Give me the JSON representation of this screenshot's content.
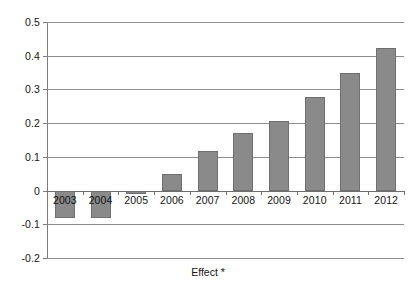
{
  "chart_data": {
    "type": "bar",
    "title": "",
    "subtitle": "",
    "xlabel": "Effect *",
    "ylabel": "",
    "categories": [
      "2003",
      "2004",
      "2005",
      "2006",
      "2007",
      "2008",
      "2009",
      "2010",
      "2011",
      "2012"
    ],
    "values": [
      -0.08,
      -0.08,
      -0.01,
      0.05,
      0.118,
      0.172,
      0.207,
      0.277,
      0.35,
      0.423
    ],
    "series": [
      {
        "name": "Effect",
        "values": [
          -0.08,
          -0.08,
          -0.01,
          0.05,
          0.118,
          0.172,
          0.207,
          0.277,
          0.35,
          0.423
        ]
      }
    ],
    "ylim": [
      -0.2,
      0.5
    ],
    "ytick_values": [
      0.5,
      0.4,
      0.3,
      0.2,
      0.1,
      0,
      -0.1,
      -0.2
    ],
    "ytick_labels": [
      "0.5",
      "0.4",
      "0.3",
      "0.2",
      "0.1",
      "0",
      "-0.1",
      "-0.2"
    ],
    "ytick_step": 0.1,
    "grid": true,
    "grid_axis": "y",
    "legend": false,
    "legend_position": "none",
    "bar_color": "#8a8a8a",
    "bar_border_color": "#6f6f6f",
    "gridline_color": "#8d8d8d",
    "axis_color": "#7d7d7d",
    "background_color": "#ffffff",
    "annotations": []
  },
  "axis": {
    "x_title": "Effect *"
  }
}
